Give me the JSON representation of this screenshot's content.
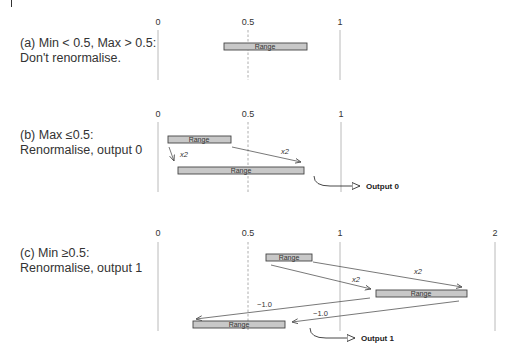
{
  "figure": {
    "panels": [
      {
        "id": "a",
        "caption_line1": "(a) Min < 0.5, Max > 0.5:",
        "caption_line2": "Don't renormalise.",
        "ticks": [
          "0",
          "0.5",
          "1"
        ],
        "ranges": [
          {
            "label": "Range",
            "from": 0.37,
            "to": 0.82
          }
        ],
        "output": null
      },
      {
        "id": "b",
        "caption_line1": "(b) Max ≤0.5:",
        "caption_line2": "Renormalise, output 0",
        "ticks": [
          "0",
          "0.5",
          "1"
        ],
        "ranges": [
          {
            "label": "Range",
            "from": 0.05,
            "to": 0.4
          },
          {
            "label": "Range",
            "from": 0.11,
            "to": 0.8
          }
        ],
        "arrows": [
          {
            "label": "x2"
          },
          {
            "label": "x2"
          }
        ],
        "output": "Output 0"
      },
      {
        "id": "c",
        "caption_line1": "(c) Min ≥0.5:",
        "caption_line2": "Renormalise, output 1",
        "ticks": [
          "0",
          "0.5",
          "1",
          "2"
        ],
        "ranges": [
          {
            "label": "Range",
            "from": 0.59,
            "to": 0.85
          },
          {
            "label": "Range",
            "from": 1.19,
            "to": 1.69
          },
          {
            "label": "Range",
            "from": 0.19,
            "to": 0.69
          }
        ],
        "arrows": [
          {
            "label": "x2"
          },
          {
            "label": "x2"
          },
          {
            "label": "−1.0"
          },
          {
            "label": "−1.0"
          }
        ],
        "output": "Output 1"
      }
    ],
    "colors": {
      "bar_fill": "#c8c8c8",
      "bar_stroke": "#444444",
      "axis_line": "#9a9a9a",
      "arrow": "#555555",
      "text": "#2a2a2a"
    }
  }
}
